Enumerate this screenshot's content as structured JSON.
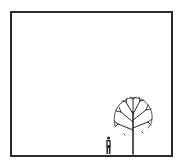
{
  "illustration": {
    "subject": "lone figure standing beside a tree in an empty frame",
    "line_color": "#2a2a2a",
    "background": "#ffffff"
  }
}
